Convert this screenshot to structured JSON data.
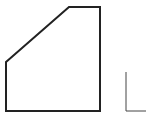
{
  "diagram": {
    "width": 152,
    "height": 124,
    "background": "#ffffff",
    "shapes": [
      {
        "id": "pentagon",
        "type": "polygon",
        "points": "6,62 69,7 100,7 100,111 6,111",
        "stroke": "#222222",
        "stroke_width": 2
      },
      {
        "id": "l-mark",
        "type": "polyline",
        "points": "126,72 126,111 146,111",
        "stroke": "#444444",
        "stroke_width": 1
      }
    ]
  }
}
